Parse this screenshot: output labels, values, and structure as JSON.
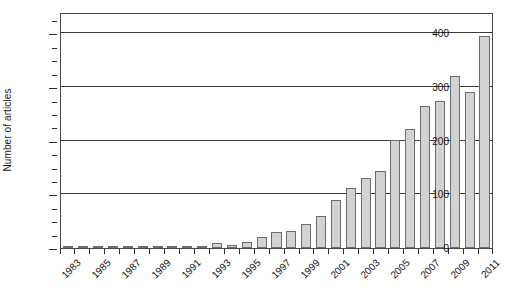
{
  "chart_data": {
    "type": "bar",
    "title": "",
    "xlabel": "",
    "ylabel": "Number of articles",
    "ylim": [
      0,
      440
    ],
    "ytick_labels": [
      "0",
      "100",
      "200",
      "300",
      "400"
    ],
    "ytick_values": [
      0,
      100,
      200,
      300,
      400
    ],
    "yminor_step": 25,
    "grid": "horizontal",
    "legend": "none",
    "categories": [
      "1983",
      "1984",
      "1985",
      "1986",
      "1987",
      "1988",
      "1989",
      "1990",
      "1991",
      "1992",
      "1993",
      "1994",
      "1995",
      "1996",
      "1997",
      "1998",
      "1999",
      "2000",
      "2001",
      "2002",
      "2003",
      "2004",
      "2005",
      "2006",
      "2007",
      "2008",
      "2009",
      "2010",
      "2011"
    ],
    "xtick_labels": [
      "1983",
      "1985",
      "1987",
      "1989",
      "1991",
      "1993",
      "1995",
      "1997",
      "1999",
      "2001",
      "2003",
      "2005",
      "2007",
      "2009",
      "2011"
    ],
    "values": [
      2,
      3,
      2,
      2,
      2,
      2,
      2,
      2,
      3,
      3,
      9,
      5,
      12,
      20,
      30,
      31,
      44,
      60,
      90,
      112,
      130,
      143,
      201,
      222,
      265,
      274,
      320,
      290,
      396
    ],
    "bar_color": "#d2d2d2",
    "bar_edge_color": "#6d6d6d",
    "axis_color": "#3b3b3b"
  }
}
